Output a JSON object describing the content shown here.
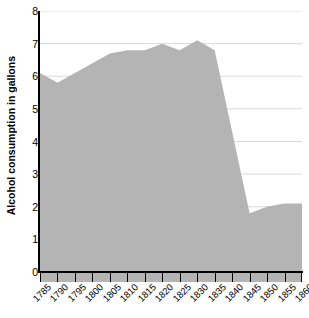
{
  "chart_data": {
    "type": "area",
    "title": "",
    "subtitle": "",
    "xlabel": "",
    "ylabel": "Alcohol consumption in gallons",
    "xlim": [
      1785,
      1860
    ],
    "ylim": [
      0,
      8
    ],
    "grid": true,
    "legend": false,
    "legend_position": "none",
    "fill_color": "#b4b4b4",
    "gridline_color": "#d9d9d9",
    "axis_color": "#000000",
    "categories": [
      "1785",
      "1790",
      "1795",
      "1800",
      "1805",
      "1810",
      "1815",
      "1820",
      "1825",
      "1830",
      "1835",
      "1840",
      "1845",
      "1850",
      "1855",
      "1860"
    ],
    "x": [
      1785,
      1790,
      1795,
      1800,
      1805,
      1810,
      1815,
      1820,
      1825,
      1830,
      1835,
      1840,
      1845,
      1850,
      1855,
      1860
    ],
    "values": [
      6.1,
      5.8,
      6.1,
      6.4,
      6.7,
      6.8,
      6.8,
      7.0,
      6.8,
      7.1,
      6.8,
      4.3,
      1.8,
      2.0,
      2.1,
      2.1
    ],
    "y_ticks": [
      0,
      1,
      2,
      3,
      4,
      5,
      6,
      7,
      8
    ],
    "y_tick_labels": [
      "0",
      "1",
      "2",
      "3",
      "4",
      "5",
      "6",
      "7",
      "8"
    ],
    "x_tick_labels": [
      "1785",
      "1790",
      "1795",
      "1800",
      "1805",
      "1810",
      "1815",
      "1820",
      "1825",
      "1830",
      "1835",
      "1840",
      "1845",
      "1850",
      "1855",
      "1860"
    ],
    "series": [
      {
        "name": "Alcohol consumption in gallons",
        "values": [
          6.1,
          5.8,
          6.1,
          6.4,
          6.7,
          6.8,
          6.8,
          7.0,
          6.8,
          7.1,
          6.8,
          4.3,
          1.8,
          2.0,
          2.1,
          2.1
        ]
      }
    ],
    "annotations": []
  }
}
